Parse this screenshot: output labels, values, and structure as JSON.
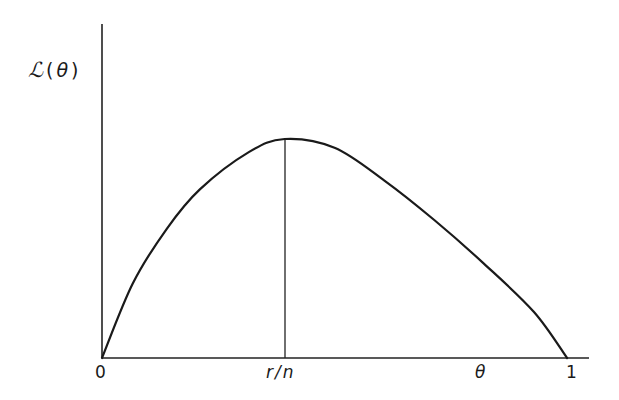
{
  "chart_data": {
    "type": "line",
    "title": "",
    "xlabel": "θ",
    "ylabel": "ℒ(θ)",
    "ylabel_parts": {
      "script": "ℒ",
      "open": "(",
      "arg": "θ",
      "close": ")"
    },
    "x_ticks": [
      "0",
      "r/n",
      "1"
    ],
    "xlim": [
      0,
      1.04
    ],
    "grid": false,
    "legend": null,
    "annotations": [
      {
        "type": "vertical-line",
        "x": "r/n",
        "description": "maximum of likelihood at θ = r/n"
      }
    ],
    "series": [
      {
        "name": "likelihood ℒ(θ)",
        "x": [
          0.0,
          0.066,
          0.139,
          0.21,
          0.315,
          0.392,
          0.499,
          0.606,
          0.713,
          0.82,
          0.927,
          0.998
        ],
        "y": [
          0.0,
          0.34,
          0.59,
          0.77,
          0.94,
          1.0,
          0.96,
          0.81,
          0.63,
          0.43,
          0.21,
          0.0
        ]
      }
    ],
    "peak": {
      "x_label": "r/n",
      "x": 0.392,
      "y": 1.0
    }
  },
  "labels": {
    "y_axis": "ℒ(θ)",
    "origin": "0",
    "mle": "r/n",
    "x_axis_var": "θ",
    "one": "1"
  }
}
